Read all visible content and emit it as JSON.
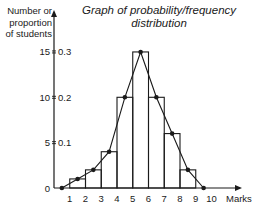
{
  "chart_data": {
    "type": "bar",
    "title": "Graph of probability/frequency distribution",
    "xlabel": "Marks",
    "ylabel": "Number or proportion of students",
    "categories": [
      "1",
      "2",
      "3",
      "4",
      "5",
      "6",
      "7",
      "8",
      "9"
    ],
    "x_ticks": [
      1,
      2,
      3,
      4,
      5,
      6,
      7,
      8,
      9,
      10
    ],
    "y_ticks": [
      {
        "value": 0,
        "label": "0"
      },
      {
        "value": 5,
        "label": "5 = 0.1"
      },
      {
        "value": 10,
        "label": "10 = 0.2"
      },
      {
        "value": 15,
        "label": "15 = 0.3"
      }
    ],
    "series": [
      {
        "name": "Histogram (frequency)",
        "type": "bar",
        "bins": [
          [
            1,
            2
          ],
          [
            2,
            3
          ],
          [
            3,
            4
          ],
          [
            4,
            5
          ],
          [
            5,
            6
          ],
          [
            6,
            7
          ],
          [
            7,
            8
          ],
          [
            8,
            9
          ],
          [
            9,
            10
          ]
        ],
        "values": [
          1,
          2,
          4,
          10,
          15,
          10,
          6,
          2,
          0
        ]
      },
      {
        "name": "Frequency polygon",
        "type": "line",
        "x": [
          0.5,
          1.5,
          2.5,
          3.5,
          4.5,
          5.5,
          6.5,
          7.5,
          8.5,
          9.5
        ],
        "values": [
          0,
          1,
          2,
          4,
          10,
          15,
          10,
          6,
          2,
          0
        ]
      }
    ],
    "xlim": [
      0,
      10.5
    ],
    "ylim": [
      0,
      16.5
    ],
    "grid": false,
    "legend": "none"
  },
  "labels": {
    "title_line1": "Graph of probability/frequency",
    "title_line2": "distribution",
    "ylabel_line1": "Number or",
    "ylabel_line2": "proportion",
    "ylabel_line3": "of students",
    "xlabel": "Marks"
  }
}
